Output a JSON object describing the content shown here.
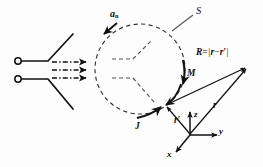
{
  "figure": {
    "background_color": "#fdfdfd",
    "ink_color": "#111111",
    "width": 263,
    "height": 167
  },
  "labels": {
    "surface": "S",
    "normal_vector": "a",
    "normal_subscript": "n",
    "magnetic_current": "M",
    "electric_current": "J",
    "distance_R": "R",
    "distance_R_equals": "=",
    "field_point_vector": "r",
    "source_point_vector": "r",
    "source_prime": "′",
    "minus": "−",
    "abs_bar": "|",
    "axis_x": "x",
    "axis_y": "y",
    "axis_z": "z"
  },
  "geometry": {
    "sphere": {
      "cx": 140,
      "cy": 69,
      "r": 45,
      "style": "dashed",
      "name": "closed-surface-S"
    },
    "axes_origin": {
      "x": 190,
      "y": 135
    },
    "field_point": {
      "x": 247,
      "y": 67
    },
    "source_point": {
      "x": 165,
      "y": 106
    },
    "horn_terminals": [
      {
        "cx": 18,
        "cy": 61,
        "r": 3.2
      },
      {
        "cx": 18,
        "cy": 79,
        "r": 3.2
      }
    ],
    "wave_arrows_y": [
      62,
      70,
      78
    ],
    "wave_arrow_x_start": 52,
    "wave_arrow_x_end": 88
  },
  "vectors": {
    "R": {
      "from": "source_point",
      "to": "field_point",
      "label": "R = |r − r′|"
    },
    "r": {
      "from": "axes_origin",
      "to": "field_point",
      "label": "r"
    },
    "r_prime": {
      "from": "axes_origin",
      "to": "source_point",
      "label": "r′"
    }
  }
}
